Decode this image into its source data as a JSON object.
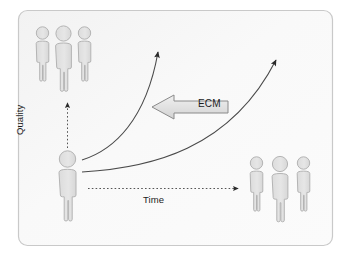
{
  "diagram": {
    "frame": {
      "fill": "#f7f7f7",
      "stroke": "#c9c9c9"
    },
    "axes": {
      "quality_label": "Quality",
      "time_label": "Time",
      "axis_color": "#555555"
    },
    "callout": {
      "label": "ECM",
      "box_fill": "#e3e3e3",
      "box_stroke": "#8a8a8a",
      "direction": "left"
    },
    "people": {
      "fill": "#e2e2e2",
      "stroke": "#b4b4b4",
      "groups": [
        {
          "name": "top-left-group",
          "count": 3,
          "position": "upper-left"
        },
        {
          "name": "center-single",
          "count": 1,
          "position": "center-left"
        },
        {
          "name": "bottom-right-group",
          "count": 3,
          "position": "lower-right"
        }
      ]
    },
    "curves": {
      "count": 2,
      "color": "#4a4a4a",
      "description": "two upward growth curves from the center figure"
    }
  }
}
